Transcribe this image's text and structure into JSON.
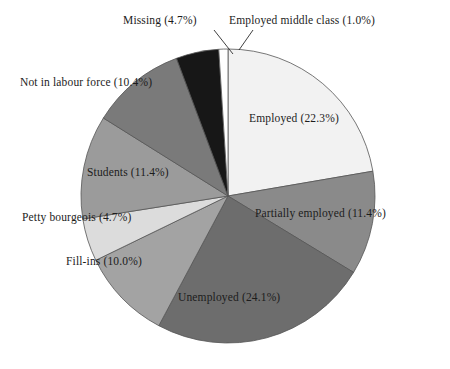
{
  "chart_data": {
    "type": "pie",
    "title": "",
    "subtitle": "",
    "xlabel": "",
    "ylabel": "",
    "legend_position": "none",
    "grid": false,
    "units": "percent",
    "total": 100.0,
    "start_angle_deg": 0,
    "direction": "clockwise",
    "center": {
      "x": 228,
      "y": 196
    },
    "radius": 147,
    "categories": [
      "Employed",
      "Partially employed",
      "Unemployed",
      "Fill-ins",
      "Petty bourgeois",
      "Students",
      "Not in labour force",
      "Missing",
      "Employed middle class"
    ],
    "values": [
      22.3,
      11.4,
      24.1,
      10.0,
      4.7,
      11.4,
      10.4,
      4.7,
      1.0
    ],
    "colors": [
      "#f2f2f2",
      "#8a8a8a",
      "#6d6d6d",
      "#a3a3a3",
      "#dcdcdc",
      "#9b9b9b",
      "#7a7a7a",
      "#171717",
      "#ffffff"
    ],
    "slices": [
      {
        "label": "Employed",
        "value": 22.3,
        "color": "#f2f2f2",
        "label_text": "Employed (22.3%)"
      },
      {
        "label": "Partially employed",
        "value": 11.4,
        "color": "#8a8a8a",
        "label_text": "Partially employed (11.4%)"
      },
      {
        "label": "Unemployed",
        "value": 24.1,
        "color": "#6d6d6d",
        "label_text": "Unemployed (24.1%)"
      },
      {
        "label": "Fill-ins",
        "value": 10.0,
        "color": "#a3a3a3",
        "label_text": "Fill-ins (10.0%)"
      },
      {
        "label": "Petty bourgeois",
        "value": 4.7,
        "color": "#dcdcdc",
        "label_text": "Petty bourgeois (4.7%)"
      },
      {
        "label": "Students",
        "value": 11.4,
        "color": "#9b9b9b",
        "label_text": "Students (11.4%)"
      },
      {
        "label": "Not in labour force",
        "value": 10.4,
        "color": "#7a7a7a",
        "label_text": "Not in labour force (10.4%)"
      },
      {
        "label": "Missing",
        "value": 4.7,
        "color": "#171717",
        "label_text": "Missing (4.7%)"
      },
      {
        "label": "Employed middle class",
        "value": 1.0,
        "color": "#ffffff",
        "label_text": "Employed middle class (1.0%)"
      }
    ]
  },
  "labels": {
    "employed": "Employed (22.3%)",
    "partially_employed": "Partially employed (11.4%)",
    "unemployed": "Unemployed (24.1%)",
    "fill_ins": "Fill-ins (10.0%)",
    "petty_bourgeois": "Petty bourgeois (4.7%)",
    "students": "Students (11.4%)",
    "not_in_labour_force": "Not in labour force (10.4%)",
    "missing": "Missing (4.7%)",
    "employed_middle_class": "Employed middle class (1.0%)"
  }
}
